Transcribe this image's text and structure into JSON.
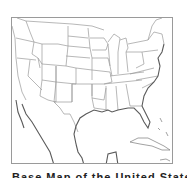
{
  "map": {
    "subject": "Outline map of the contiguous United States with state boundaries, Gulf of Mexico, Mexico, and Caribbean islands",
    "colors": {
      "background": "#ffffff",
      "state_border": "#9a9a9a",
      "coastline": "#5a5a5a",
      "frame": "#9a9a9a"
    }
  },
  "caption": {
    "text": "Base Map of the United States"
  }
}
